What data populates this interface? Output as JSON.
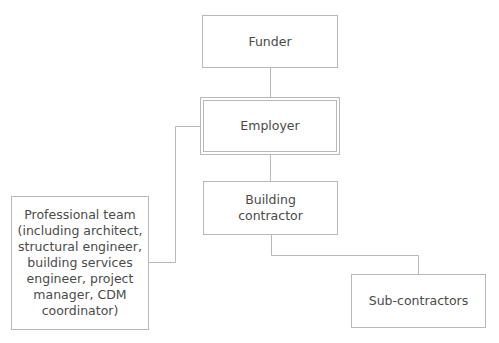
{
  "diagram": {
    "type": "organizational-hierarchy",
    "nodes": {
      "funder": {
        "label": "Funder"
      },
      "employer": {
        "label": "Employer",
        "style": "double-border"
      },
      "building_contractor": {
        "label": "Building\ncontractor"
      },
      "professional_team": {
        "label": "Professional team\n(including architect,\nstructural engineer,\nbuilding services\nengineer, project\nmanager, CDM\ncoordinator)"
      },
      "sub_contractors": {
        "label": "Sub-contractors"
      }
    },
    "edges": [
      {
        "from": "funder",
        "to": "employer"
      },
      {
        "from": "employer",
        "to": "building_contractor"
      },
      {
        "from": "employer",
        "to": "professional_team"
      },
      {
        "from": "building_contractor",
        "to": "sub_contractors"
      }
    ],
    "colors": {
      "line": "#b8b8b8",
      "text": "#4a4a4a",
      "background": "#ffffff"
    }
  }
}
